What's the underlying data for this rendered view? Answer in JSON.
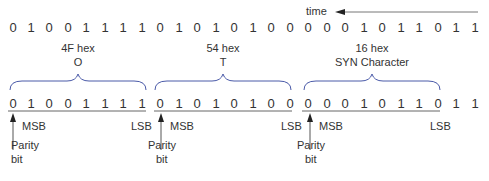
{
  "time_label": "time",
  "top_row": {
    "bits": [
      "0",
      "1",
      "0",
      "0",
      "1",
      "1",
      "1",
      "1",
      "0",
      "1",
      "0",
      "1",
      "0",
      "1",
      "0",
      "0",
      "0",
      "0",
      "0",
      "1",
      "0",
      "1",
      "1",
      "0",
      "1",
      "1"
    ]
  },
  "groups": [
    {
      "hex": "4F hex",
      "char": "O"
    },
    {
      "hex": "54 hex",
      "char": "T"
    },
    {
      "hex": "16 hex",
      "char": "SYN Character"
    }
  ],
  "bottom_row": {
    "bits": [
      "0",
      "1",
      "0",
      "0",
      "1",
      "1",
      "1",
      "1",
      "0",
      "1",
      "0",
      "1",
      "0",
      "1",
      "0",
      "0",
      "0",
      "0",
      "0",
      "1",
      "0",
      "1",
      "1",
      "0",
      "1",
      "1"
    ]
  },
  "annotations": {
    "msb": "MSB",
    "lsb": "LSB",
    "parity_line1": "Parity",
    "parity_line2": "bit"
  },
  "colors": {
    "brace": "#4a5aa8",
    "text": "#333333",
    "line": "#555555"
  }
}
